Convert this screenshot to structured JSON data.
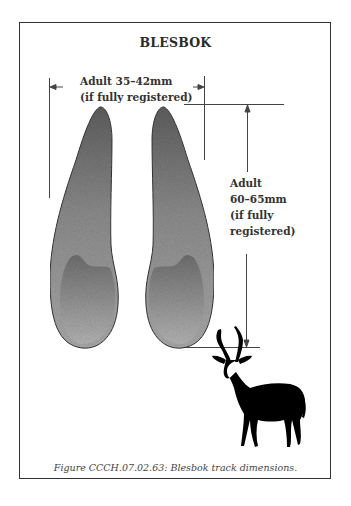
{
  "figure": {
    "title": "BLESBOK",
    "width_label": {
      "line1": "Adult 35–42mm",
      "line2": "(if fully registered)"
    },
    "length_label": {
      "line1": "Adult",
      "line2": "60–65mm",
      "line3": "(if fully",
      "line4": "registered)"
    },
    "caption": "Figure CCCH.07.02.63:  Blesbok track dimensions.",
    "illustrations": [
      "left-hoof-print",
      "right-hoof-print",
      "blesbok-silhouette"
    ],
    "colors": {
      "frame": "#333333",
      "print_outer": "#8a8a8a",
      "print_inner": "#9a9a9a",
      "silhouette": "#000000",
      "dimension_lines": "#444444"
    }
  }
}
